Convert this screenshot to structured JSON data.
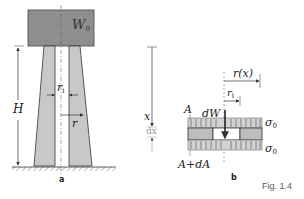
{
  "figure": {
    "caption": "Fig. 1.4",
    "panel_a": {
      "label": "a",
      "weight_label": "W",
      "weight_sub": "0",
      "height_label": "H",
      "inner_radius_label": "r",
      "inner_radius_sub": "i",
      "radius_label": "r"
    },
    "panel_b": {
      "label": "b",
      "axis_label": "x",
      "increment_label": "dx",
      "radius_fn_label": "r(x)",
      "inner_radius_label": "r",
      "inner_radius_sub": "i",
      "top_area_label": "A",
      "bottom_area_label": "A+dA",
      "weight_increment_label": "dW",
      "stress_top_label": "σ",
      "stress_top_sub": "0",
      "stress_bottom_label": "σ",
      "stress_bottom_sub": "0"
    }
  },
  "colors": {
    "fill_gray": "#c8c8c8",
    "block_gray": "#8e8e8e",
    "stroke": "#333333",
    "light_stroke": "#999999"
  }
}
